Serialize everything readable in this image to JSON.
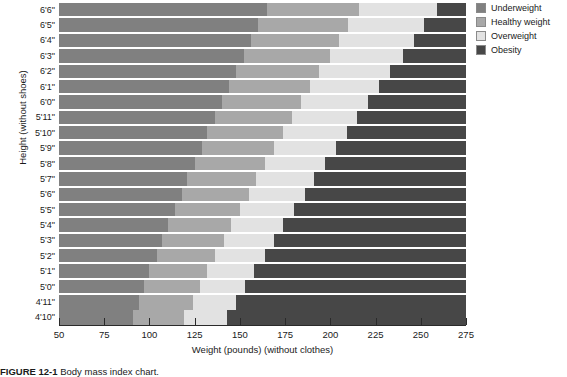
{
  "chart_data": {
    "type": "area",
    "title": "",
    "xlabel": "Weight (pounds) (without clothes)",
    "ylabel": "Height (without shoes)",
    "xlim": [
      50,
      275
    ],
    "xticks": [
      50,
      75,
      100,
      125,
      150,
      175,
      200,
      225,
      250,
      275
    ],
    "grid": true,
    "legend_position": "right",
    "categories": [
      "4'10\"",
      "4'11\"",
      "5'0\"",
      "5'1\"",
      "5'2\"",
      "5'3\"",
      "5'4\"",
      "5'5\"",
      "5'6\"",
      "5'7\"",
      "5'8\"",
      "5'9\"",
      "5'10\"",
      "5'11\"",
      "6'0\"",
      "6'1\"",
      "6'2\"",
      "6'3\"",
      "6'4\"",
      "6'5\"",
      "6'6\""
    ],
    "series": [
      {
        "name": "Underweight",
        "color": "#808080",
        "note": "below healthy weight boundary"
      },
      {
        "name": "Healthy weight",
        "color": "#a8a8a8",
        "note": "between underweight and overweight boundaries"
      },
      {
        "name": "Overweight",
        "color": "#e2e2e2",
        "note": "between healthy weight and obesity boundaries"
      },
      {
        "name": "Obesity",
        "color": "#474747",
        "note": "above overweight boundary"
      }
    ],
    "boundaries": {
      "description": "Weight in pounds at each height marking the band edges",
      "underweight_to_healthy": [
        91,
        94,
        97,
        100,
        104,
        107,
        110,
        114,
        118,
        121,
        125,
        129,
        132,
        136,
        140,
        144,
        148,
        152,
        156,
        160,
        165
      ],
      "healthy_to_overweight": [
        119,
        124,
        128,
        132,
        136,
        141,
        145,
        150,
        155,
        159,
        164,
        169,
        174,
        179,
        184,
        189,
        194,
        200,
        205,
        210,
        216
      ],
      "overweight_to_obesity": [
        143,
        148,
        153,
        158,
        164,
        169,
        174,
        180,
        186,
        191,
        197,
        203,
        209,
        215,
        221,
        227,
        233,
        240,
        246,
        252,
        259
      ]
    }
  },
  "axes": {
    "y_title": "Height (without shoes)",
    "x_title": "Weight (pounds) (without clothes)",
    "y_tick_labels": [
      "6'6\"",
      "6'5\"",
      "6'4\"",
      "6'3\"",
      "6'2\"",
      "6'1\"",
      "6'0\"",
      "5'11\"",
      "5'10\"",
      "5'9\"",
      "5'8\"",
      "5'7\"",
      "5'6\"",
      "5'5\"",
      "5'4\"",
      "5'3\"",
      "5'2\"",
      "5'1\"",
      "5'0\"",
      "4'11\"",
      "4'10\""
    ],
    "x_tick_labels": [
      "50",
      "75",
      "100",
      "125",
      "150",
      "175",
      "200",
      "225",
      "250",
      "275"
    ]
  },
  "legend": {
    "items": [
      {
        "label": "Underweight",
        "color": "#808080"
      },
      {
        "label": "Healthy weight",
        "color": "#a8a8a8"
      },
      {
        "label": "Overweight",
        "color": "#e2e2e2"
      },
      {
        "label": "Obesity",
        "color": "#474747"
      }
    ]
  },
  "caption": {
    "figure_number": "FIGURE 12-1",
    "text": "Body mass index chart."
  }
}
